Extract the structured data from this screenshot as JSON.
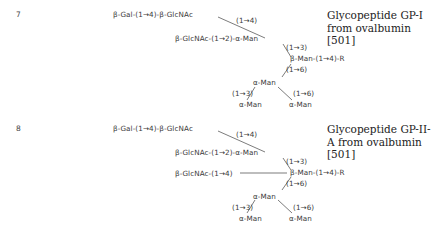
{
  "structures": [
    {
      "number": "7",
      "title": "Glycopeptide GP-I from ovalbumin [501]",
      "title_lines": [
        "Glycopeptide GP-I",
        "from ovalbumin",
        "[501]"
      ],
      "labels": {
        "branch_top": "β-Gal-(1→4)-β-GlcNAc",
        "link_top": "(1→4)",
        "branch_mid": "β-GlcNAc-(1→2)-α-Man",
        "link_13": "(1→3)",
        "core": "β-Man-(1→4)-R",
        "link_16": "(1→6)",
        "lower_man": "α-Man",
        "link_low_13": "(1→3)",
        "link_low_16": "(1→6)",
        "leaf_left": "α-Man",
        "leaf_right": "α-Man"
      }
    },
    {
      "number": "8",
      "title": "Glycopeptide GP-II-A from ovalbumin [501]",
      "title_lines": [
        "Glycopeptide GP-II-",
        "A from ovalbumin",
        "[501]"
      ],
      "labels": {
        "branch_top": "β-Gal-(1→4)-β-GlcNAc",
        "link_top": "(1→4)",
        "branch_mid": "β-GlcNAc-(1→2)-α-Man",
        "link_13": "(1→3)",
        "bisect": "β-GlcNAc-(1→4)",
        "core": "β-Man-(1→4)-R",
        "link_16": "(1→6)",
        "lower_man": "α-Man",
        "link_low_13": "(1→3)",
        "link_low_16": "(1→6)",
        "leaf_left": "α-Man",
        "leaf_right": "α-Man"
      }
    }
  ]
}
